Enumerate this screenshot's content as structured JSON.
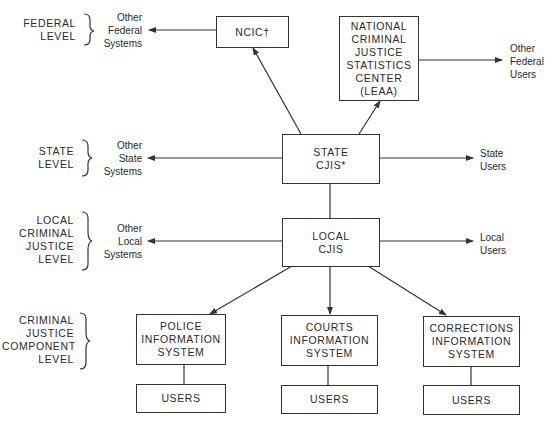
{
  "levels": [
    {
      "id": "federal",
      "lines": [
        "FEDERAL",
        "LEVEL"
      ]
    },
    {
      "id": "state",
      "lines": [
        "STATE",
        "LEVEL"
      ]
    },
    {
      "id": "local",
      "lines": [
        "LOCAL",
        "CRIMINAL",
        "JUSTICE",
        "LEVEL"
      ]
    },
    {
      "id": "component",
      "lines": [
        "CRIMINAL",
        "JUSTICE",
        "COMPONENT",
        "LEVEL"
      ]
    }
  ],
  "nodes": {
    "ncic": {
      "lines": [
        "NCIC†"
      ]
    },
    "ncjss": {
      "lines": [
        "NATIONAL",
        "CRIMINAL",
        "JUSTICE",
        "STATISTICS",
        "CENTER",
        "(LEAA)"
      ]
    },
    "state_cjis": {
      "lines": [
        "STATE",
        "CJIS*"
      ]
    },
    "local_cjis": {
      "lines": [
        "LOCAL",
        "CJIS"
      ]
    },
    "police": {
      "lines": [
        "POLICE",
        "INFORMATION",
        "SYSTEM"
      ]
    },
    "courts": {
      "lines": [
        "COURTS",
        "INFORMATION",
        "SYSTEM"
      ]
    },
    "corrections": {
      "lines": [
        "CORRECTIONS",
        "INFORMATION",
        "SYSTEM"
      ]
    },
    "police_users": {
      "lines": [
        "USERS"
      ]
    },
    "courts_users": {
      "lines": [
        "USERS"
      ]
    },
    "corrections_users": {
      "lines": [
        "USERS"
      ]
    }
  },
  "externals": {
    "other_federal_systems": {
      "lines": [
        "Other",
        "Federal",
        "Systems"
      ]
    },
    "other_federal_users": {
      "lines": [
        "Other",
        "Federal",
        "Users"
      ]
    },
    "other_state_systems": {
      "lines": [
        "Other",
        "State",
        "Systems"
      ]
    },
    "state_users": {
      "lines": [
        "State",
        "Users"
      ]
    },
    "other_local_systems": {
      "lines": [
        "Other",
        "Local",
        "Systems"
      ]
    },
    "local_users": {
      "lines": [
        "Local",
        "Users"
      ]
    }
  },
  "edges": [
    {
      "from": "ncic",
      "to": "other_federal_systems",
      "arrow": true
    },
    {
      "from": "state_cjis",
      "to": "ncic",
      "arrow": true
    },
    {
      "from": "state_cjis",
      "to": "ncjss",
      "arrow": true
    },
    {
      "from": "ncjss",
      "to": "other_federal_users",
      "arrow": true
    },
    {
      "from": "state_cjis",
      "to": "other_state_systems",
      "arrow": true
    },
    {
      "from": "state_cjis",
      "to": "state_users",
      "arrow": true
    },
    {
      "from": "state_cjis",
      "to": "local_cjis",
      "arrow": false
    },
    {
      "from": "local_cjis",
      "to": "other_local_systems",
      "arrow": true
    },
    {
      "from": "local_cjis",
      "to": "local_users",
      "arrow": true
    },
    {
      "from": "local_cjis",
      "to": "police",
      "arrow": true
    },
    {
      "from": "local_cjis",
      "to": "courts",
      "arrow": true
    },
    {
      "from": "local_cjis",
      "to": "corrections",
      "arrow": true
    },
    {
      "from": "police",
      "to": "police_users",
      "arrow": false
    },
    {
      "from": "courts",
      "to": "courts_users",
      "arrow": false
    },
    {
      "from": "corrections",
      "to": "corrections_users",
      "arrow": false
    }
  ],
  "colors": {
    "stroke": "#333333",
    "text": "#2a2a2a",
    "background": "#ffffff"
  }
}
